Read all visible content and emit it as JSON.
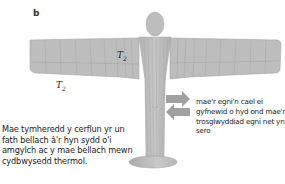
{
  "figure": {
    "panel_label": "b",
    "temp_label_symbol": "T",
    "temp_label_subscript": "2",
    "caption_left": "Mae tymheredd y cerflun yr un fath bellach â'r hyn sydd o'i amgylch ac y mae bellach mewn cydbwysedd thermol.",
    "caption_right": "mae'r egni'n cael ei gyfnewid o hyd ond mae'r trosglwyddiad egni net yn sero",
    "icons": [
      "statue-figure",
      "arrow-right-icon",
      "arrow-left-icon"
    ],
    "colors": {
      "statue_fill": "#bdbdbd",
      "statue_line": "#9a9a9a",
      "arrow_fill": "#8f8f8f",
      "background": "#ffffff"
    }
  }
}
